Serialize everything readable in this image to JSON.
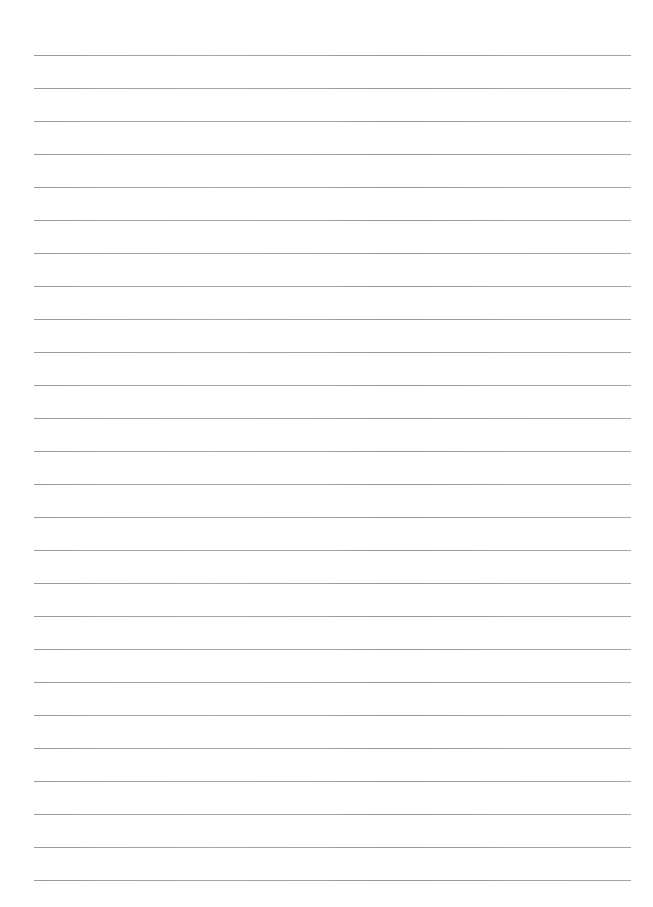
{
  "page": {
    "type": "ruled-paper",
    "background_color": "#ffffff",
    "line_color": "#a0a0a0",
    "line_count": 26,
    "first_line_y": 55,
    "line_spacing": 33,
    "line_left": 34,
    "line_right": 631,
    "text_lines": [
      "",
      "",
      "",
      "",
      "",
      "",
      "",
      "",
      "",
      "",
      "",
      "",
      "",
      "",
      "",
      "",
      "",
      "",
      "",
      "",
      "",
      "",
      "",
      "",
      "",
      ""
    ]
  }
}
